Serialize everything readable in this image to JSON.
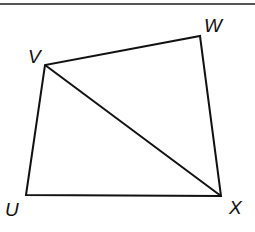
{
  "figure": {
    "type": "quadrilateral-with-diagonal",
    "stroke_color": "#111111",
    "rule_color": "#555555",
    "vertices": {
      "U": {
        "label": "U",
        "x": 26,
        "y": 195
      },
      "V": {
        "label": "V",
        "x": 45,
        "y": 65
      },
      "W": {
        "label": "W",
        "x": 200,
        "y": 36
      },
      "X": {
        "label": "X",
        "x": 221,
        "y": 196
      }
    },
    "edges": [
      "UV",
      "VW",
      "WX",
      "XU"
    ],
    "diagonals": [
      "VX"
    ]
  }
}
